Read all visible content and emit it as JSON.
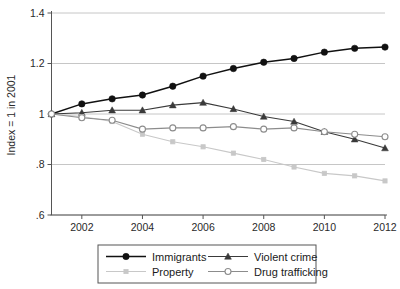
{
  "chart_data": {
    "type": "line",
    "title": "",
    "xlabel": "",
    "ylabel": "Index = 1 in 2001",
    "x": [
      2001,
      2002,
      2003,
      2004,
      2005,
      2006,
      2007,
      2008,
      2009,
      2010,
      2011,
      2012
    ],
    "xtick_labels": [
      "2002",
      "2004",
      "2006",
      "2008",
      "2010",
      "2012"
    ],
    "xticks": [
      2002,
      2004,
      2006,
      2008,
      2010,
      2012
    ],
    "ytick_labels": [
      ".6",
      ".8",
      "1",
      "1.2",
      "1.4"
    ],
    "yticks": [
      0.6,
      0.8,
      1.0,
      1.2,
      1.4
    ],
    "xlim": [
      2001,
      2012
    ],
    "ylim": [
      0.6,
      1.4
    ],
    "grid": "horizontal",
    "legend_position": "bottom",
    "series": [
      {
        "name": "Immigrants",
        "marker": "filled-circle",
        "color": "#111111",
        "values": [
          1.0,
          1.04,
          1.06,
          1.075,
          1.11,
          1.15,
          1.18,
          1.205,
          1.22,
          1.245,
          1.26,
          1.265
        ]
      },
      {
        "name": "Violent crime",
        "marker": "filled-triangle",
        "color": "#3a3a3a",
        "values": [
          1.0,
          1.005,
          1.015,
          1.015,
          1.035,
          1.045,
          1.02,
          0.99,
          0.97,
          0.93,
          0.9,
          0.865
        ]
      },
      {
        "name": "Property",
        "marker": "small-square",
        "color": "#c8c8c8",
        "values": [
          1.0,
          0.99,
          0.97,
          0.92,
          0.89,
          0.87,
          0.845,
          0.82,
          0.79,
          0.765,
          0.755,
          0.735
        ]
      },
      {
        "name": "Drug trafficking",
        "marker": "open-circle",
        "color": "#8c8c8c",
        "values": [
          1.0,
          0.985,
          0.975,
          0.94,
          0.945,
          0.945,
          0.95,
          0.94,
          0.945,
          0.93,
          0.92,
          0.91
        ]
      }
    ]
  },
  "legend": {
    "entries": [
      {
        "label": "Immigrants"
      },
      {
        "label": "Violent crime"
      },
      {
        "label": "Property"
      },
      {
        "label": "Drug trafficking"
      }
    ],
    "border_color": "#555555"
  },
  "axes": {
    "axis_color": "#555555",
    "grid_color": "#b8b8b8"
  }
}
